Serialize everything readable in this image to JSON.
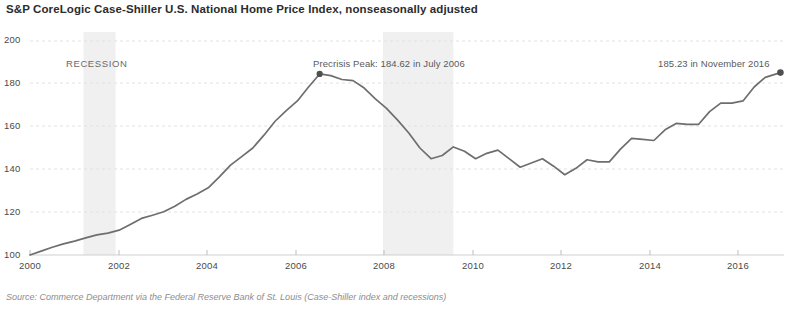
{
  "chart_data": {
    "type": "line",
    "title": "S&P CoreLogic Case-Shiller U.S. National Home Price Index, nonseasonally adjusted",
    "xlabel": "",
    "ylabel": "",
    "xlim": [
      2000,
      2016.92
    ],
    "ylim": [
      98,
      202
    ],
    "grid": true,
    "legend_position": "none",
    "x_ticks": [
      "2000",
      "2002",
      "2004",
      "2006",
      "2008",
      "2010",
      "2012",
      "2014",
      "2016"
    ],
    "x_tick_values": [
      2000,
      2002,
      2004,
      2006,
      2008,
      2010,
      2012,
      2014,
      2016
    ],
    "y_ticks": [
      "100",
      "120",
      "140",
      "160",
      "180",
      "200"
    ],
    "y_tick_values": [
      100,
      120,
      140,
      160,
      180,
      200
    ],
    "series": [
      {
        "name": "S&P CoreLogic Case-Shiller U.S. National Home Price Index",
        "color": "#6e6e6e",
        "x": [
          2000.0,
          2000.25,
          2000.5,
          2000.75,
          2001.0,
          2001.25,
          2001.5,
          2001.75,
          2002.0,
          2002.25,
          2002.5,
          2002.75,
          2003.0,
          2003.25,
          2003.5,
          2003.75,
          2004.0,
          2004.25,
          2004.5,
          2004.75,
          2005.0,
          2005.25,
          2005.5,
          2005.75,
          2006.0,
          2006.25,
          2006.5,
          2006.75,
          2007.0,
          2007.25,
          2007.5,
          2007.75,
          2008.0,
          2008.25,
          2008.5,
          2008.75,
          2009.0,
          2009.25,
          2009.5,
          2009.75,
          2010.0,
          2010.25,
          2010.5,
          2010.75,
          2011.0,
          2011.25,
          2011.5,
          2011.75,
          2012.0,
          2012.25,
          2012.5,
          2012.75,
          2013.0,
          2013.25,
          2013.5,
          2013.75,
          2014.0,
          2014.25,
          2014.5,
          2014.75,
          2015.0,
          2015.25,
          2015.5,
          2015.75,
          2016.0,
          2016.25,
          2016.5,
          2016.84
        ],
        "values": [
          100.0,
          101.8,
          103.6,
          105.2,
          106.5,
          108.0,
          109.4,
          110.2,
          111.6,
          114.3,
          117.1,
          118.6,
          120.2,
          122.8,
          126.0,
          128.5,
          131.4,
          136.5,
          142.0,
          146.0,
          150.0,
          156.0,
          162.5,
          167.5,
          172.0,
          178.5,
          184.6,
          183.8,
          182.0,
          181.5,
          178.0,
          173.0,
          168.5,
          163.0,
          157.0,
          150.0,
          145.0,
          146.5,
          150.5,
          148.5,
          145.0,
          147.5,
          149.0,
          145.0,
          141.0,
          143.0,
          145.0,
          141.5,
          137.5,
          140.5,
          144.5,
          143.5,
          143.5,
          149.5,
          154.5,
          154.0,
          153.5,
          158.5,
          161.5,
          161.0,
          161.0,
          167.0,
          171.0,
          171.0,
          172.0,
          178.5,
          183.0,
          185.23
        ]
      }
    ],
    "markers": [
      {
        "name": "precrisis-peak",
        "x": 2006.5,
        "y": 184.62
      },
      {
        "name": "latest-value",
        "x": 2016.84,
        "y": 185.23
      }
    ],
    "annotations": [
      {
        "name": "precrisis-peak-label",
        "text": "Precrisis Peak: 184.62 in July 2006"
      },
      {
        "name": "latest-value-label",
        "text": "185.23 in November 2016"
      },
      {
        "name": "recession-label",
        "text": "RECESSION"
      }
    ],
    "shaded_bands": [
      {
        "name": "recession-2001",
        "x_start": 2001.2,
        "x_end": 2001.92,
        "color": "#f0f0f0"
      },
      {
        "name": "recession-2008",
        "x_start": 2007.92,
        "x_end": 2009.5,
        "color": "#f0f0f0"
      }
    ]
  },
  "chart": {
    "title": "S&P CoreLogic Case-Shiller U.S. National Home Price Index, nonseasonally adjusted",
    "source": "Source: Commerce Department via the Federal Reserve Bank of St. Louis (Case-Shiller index and recessions)",
    "y_labels": [
      "200",
      "180",
      "160",
      "140",
      "120",
      "100"
    ],
    "x_labels": [
      "2000",
      "2002",
      "2004",
      "2006",
      "2008",
      "2010",
      "2012",
      "2014",
      "2016"
    ],
    "peak_annotation": "Precrisis Peak: 184.62 in July 2006",
    "latest_annotation": "185.23 in November 2016",
    "recession_label": "RECESSION",
    "line_color": "#6e6e6e",
    "band_color": "#f0f0f0",
    "grid_color": "#e2e2e2"
  }
}
